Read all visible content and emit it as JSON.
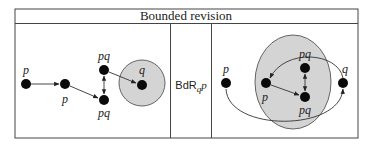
{
  "figure": {
    "title": "Bounded revision",
    "operator": {
      "prefix": "BdR",
      "subscript": "q",
      "argument": "p"
    },
    "left_panel": {
      "nodes": [
        {
          "id": "n1",
          "label": "p",
          "x": 26,
          "y": 84,
          "label_pos": "above"
        },
        {
          "id": "n2",
          "label": "p",
          "x": 65,
          "y": 84,
          "label_pos": "below"
        },
        {
          "id": "n3",
          "label": "pq",
          "x": 104,
          "y": 70,
          "label_pos": "above"
        },
        {
          "id": "n4",
          "label": "pq",
          "x": 104,
          "y": 100,
          "label_pos": "below"
        },
        {
          "id": "n5",
          "label": "q",
          "x": 142,
          "y": 85,
          "label_pos": "above"
        }
      ],
      "region": {
        "shape": "circle",
        "cx": 142,
        "cy": 83,
        "r": 23,
        "contains": [
          "n5"
        ]
      },
      "edges": [
        {
          "from": "n1",
          "to": "n2",
          "type": "arrow"
        },
        {
          "from": "n2",
          "to": "n4",
          "type": "arrow"
        },
        {
          "from": "n3",
          "to": "n4",
          "type": "bidirectional"
        },
        {
          "from": "n3",
          "to": "n5",
          "type": "arrow"
        }
      ]
    },
    "right_panel": {
      "nodes": [
        {
          "id": "m1",
          "label": "p",
          "x": 226,
          "y": 83,
          "label_pos": "above"
        },
        {
          "id": "m2",
          "label": "p",
          "x": 266,
          "y": 83,
          "label_pos": "below"
        },
        {
          "id": "m3",
          "label": "pq",
          "x": 305,
          "y": 68,
          "label_pos": "above"
        },
        {
          "id": "m4",
          "label": "pq",
          "x": 305,
          "y": 97,
          "label_pos": "below"
        },
        {
          "id": "m5",
          "label": "q",
          "x": 343,
          "y": 83,
          "label_pos": "above"
        }
      ],
      "region": {
        "shape": "ellipse",
        "cx": 293,
        "cy": 82,
        "rx": 38,
        "ry": 47,
        "contains": [
          "m2",
          "m3",
          "m4"
        ]
      },
      "edges": [
        {
          "from": "m2",
          "to": "m4",
          "type": "arrow"
        },
        {
          "from": "m3",
          "to": "m4",
          "type": "bidirectional"
        },
        {
          "from": "m5",
          "to": "m2",
          "type": "curved-arrow-over"
        },
        {
          "from": "m1",
          "to": "m5",
          "type": "curved-arrow-under"
        }
      ]
    },
    "colors": {
      "node": "#0a0a0a",
      "region_fill": "#d4d4d4",
      "line": "#333333"
    }
  }
}
